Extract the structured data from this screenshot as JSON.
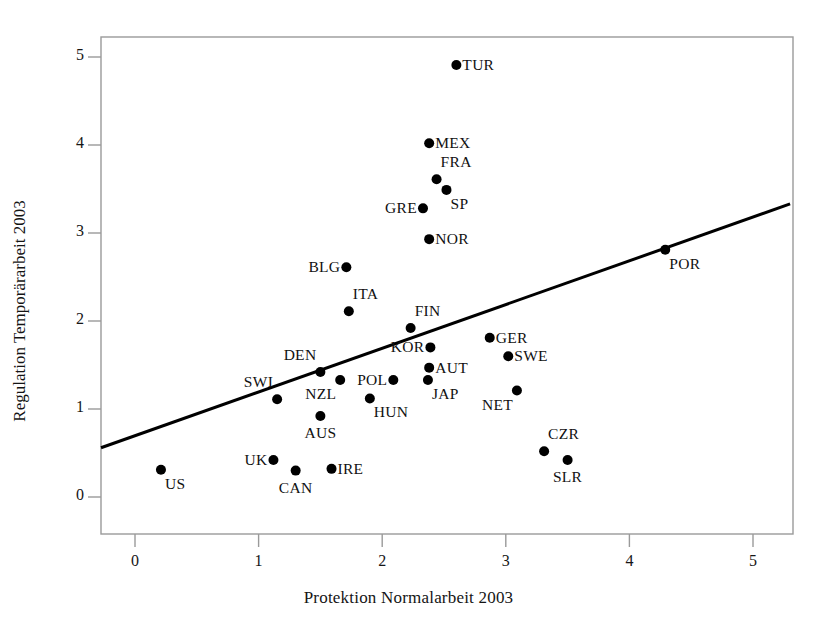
{
  "figure": {
    "width": 817,
    "height": 621,
    "background": "#ffffff",
    "ink_color": "#111111"
  },
  "chart_data": {
    "type": "scatter",
    "title": "",
    "xlabel": "Protektion Normalarbeit 2003",
    "ylabel": "Regulation Temporärarbeit 2003",
    "xlim": [
      -0.3,
      5.3
    ],
    "ylim": [
      -0.25,
      5.35
    ],
    "xticks": [
      0,
      1,
      2,
      3,
      4,
      5
    ],
    "yticks": [
      0,
      1,
      2,
      3,
      4,
      5
    ],
    "xtick_labels": [
      "0",
      "1",
      "2",
      "3",
      "4",
      "5"
    ],
    "ytick_labels": [
      "0",
      "1",
      "2",
      "3",
      "4",
      "5"
    ],
    "grid": false,
    "legend": false,
    "marker": "filled-circle",
    "marker_color": "#000000",
    "marker_size_px": 9,
    "points": [
      {
        "label": "TUR",
        "x": 2.6,
        "y": 4.91,
        "label_pos": "right"
      },
      {
        "label": "MEX",
        "x": 2.38,
        "y": 4.02,
        "label_pos": "right"
      },
      {
        "label": "FRA",
        "x": 2.44,
        "y": 3.61,
        "label_pos": "upper-right"
      },
      {
        "label": "SP",
        "x": 2.52,
        "y": 3.49,
        "label_pos": "lower-right"
      },
      {
        "label": "GRE",
        "x": 2.33,
        "y": 3.28,
        "label_pos": "left"
      },
      {
        "label": "NOR",
        "x": 2.38,
        "y": 2.93,
        "label_pos": "right"
      },
      {
        "label": "POR",
        "x": 4.29,
        "y": 2.81,
        "label_pos": "lower-right"
      },
      {
        "label": "BLG",
        "x": 1.71,
        "y": 2.61,
        "label_pos": "left"
      },
      {
        "label": "ITA",
        "x": 1.73,
        "y": 2.11,
        "label_pos": "upper-right"
      },
      {
        "label": "FIN",
        "x": 2.23,
        "y": 1.92,
        "label_pos": "upper-right"
      },
      {
        "label": "GER",
        "x": 2.87,
        "y": 1.81,
        "label_pos": "right"
      },
      {
        "label": "KOR",
        "x": 2.39,
        "y": 1.7,
        "label_pos": "left"
      },
      {
        "label": "SWE",
        "x": 3.02,
        "y": 1.6,
        "label_pos": "right"
      },
      {
        "label": "AUT",
        "x": 2.38,
        "y": 1.47,
        "label_pos": "right"
      },
      {
        "label": "DEN",
        "x": 1.5,
        "y": 1.42,
        "label_pos": "upper-left"
      },
      {
        "label": "POL",
        "x": 2.09,
        "y": 1.33,
        "label_pos": "left"
      },
      {
        "label": "JAP",
        "x": 2.37,
        "y": 1.33,
        "label_pos": "lower-right"
      },
      {
        "label": "NZL",
        "x": 1.66,
        "y": 1.33,
        "label_pos": "lower-left"
      },
      {
        "label": "NET",
        "x": 3.09,
        "y": 1.21,
        "label_pos": "lower-left"
      },
      {
        "label": "HUN",
        "x": 1.9,
        "y": 1.12,
        "label_pos": "lower-right"
      },
      {
        "label": "SWI",
        "x": 1.15,
        "y": 1.11,
        "label_pos": "upper-left"
      },
      {
        "label": "AUS",
        "x": 1.5,
        "y": 0.92,
        "label_pos": "below"
      },
      {
        "label": "CZR",
        "x": 3.31,
        "y": 0.52,
        "label_pos": "upper-right"
      },
      {
        "label": "SLR",
        "x": 3.5,
        "y": 0.42,
        "label_pos": "below"
      },
      {
        "label": "UK",
        "x": 1.12,
        "y": 0.42,
        "label_pos": "left"
      },
      {
        "label": "IRE",
        "x": 1.59,
        "y": 0.32,
        "label_pos": "right"
      },
      {
        "label": "CAN",
        "x": 1.3,
        "y": 0.3,
        "label_pos": "below"
      },
      {
        "label": "US",
        "x": 0.21,
        "y": 0.31,
        "label_pos": "lower-right"
      }
    ],
    "trendline": {
      "type": "linear-fit",
      "color": "#000000",
      "width_px": 3,
      "x_start": -0.28,
      "y_start": 0.56,
      "x_end": 5.3,
      "y_end": 3.33
    }
  }
}
